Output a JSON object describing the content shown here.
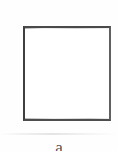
{
  "figure": {
    "type": "empty-rectangle-outline",
    "caption": "a",
    "caption_note": "clipped-by-bottom-edge",
    "shape": {
      "name": "rectangle",
      "fill": "#ffffff",
      "stroke": "#4a4a4a",
      "stroke_width_px": 2,
      "x": 23,
      "y": 26,
      "width": 88,
      "height": 95,
      "content": ""
    },
    "canvas": {
      "width": 118,
      "height": 151,
      "background": "#fefefe"
    }
  }
}
